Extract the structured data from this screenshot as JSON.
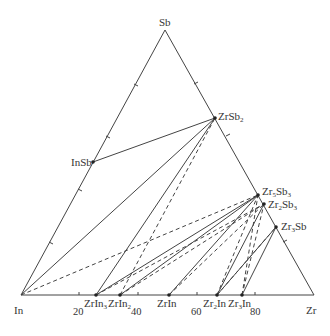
{
  "diagram": {
    "type": "ternary-phase-diagram",
    "vertices": {
      "top": {
        "label": "Sb"
      },
      "left": {
        "label": "In"
      },
      "right": {
        "label": "Zr"
      }
    },
    "axis_ticks": [
      "20",
      "40",
      "60",
      "80"
    ],
    "phases": [
      {
        "id": "InSb",
        "main": "InSb",
        "sub": ""
      },
      {
        "id": "ZrSb2",
        "main": "ZrSb",
        "sub": "2"
      },
      {
        "id": "Zr5Sb3",
        "main": "Zr",
        "sub1": "5",
        "main2": "Sb",
        "sub2": "3"
      },
      {
        "id": "Zr2Sb3",
        "main": "Zr",
        "sub1": "2",
        "main2": "Sb",
        "sub2": "3"
      },
      {
        "id": "Zr3Sb",
        "main": "Zr",
        "sub1": "3",
        "main2": "Sb",
        "sub2": ""
      },
      {
        "id": "ZrIn3",
        "main": "ZrIn",
        "sub": "3"
      },
      {
        "id": "ZrIn2",
        "main": "ZrIn",
        "sub": "2"
      },
      {
        "id": "ZrIn",
        "main": "ZrIn",
        "sub": ""
      },
      {
        "id": "Zr2In",
        "main": "Zr",
        "sub1": "2",
        "main2": "In",
        "sub2": ""
      },
      {
        "id": "Zr3In",
        "main": "Zr",
        "sub1": "3",
        "main2": "In",
        "sub2": ""
      }
    ]
  }
}
